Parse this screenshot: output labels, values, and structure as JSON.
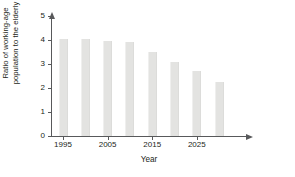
{
  "chart_data": {
    "type": "bar",
    "title": "",
    "xlabel": "Year",
    "ylabel_lines": [
      "Ratio of working-age",
      "population to the elderly"
    ],
    "ylabel": "Ratio of working-age population to the elderly",
    "categories": [
      "1995",
      "2000",
      "2005",
      "2010",
      "2015",
      "2020",
      "2025",
      "2030"
    ],
    "values": [
      4.05,
      4.05,
      3.95,
      3.92,
      3.5,
      3.1,
      2.7,
      2.25
    ],
    "x_tick_labels": [
      "1995",
      "2005",
      "2015",
      "2025"
    ],
    "x_tick_categories": [
      "1995",
      "2005",
      "2015",
      "2025"
    ],
    "y_tick_labels": [
      "0",
      "1",
      "2",
      "3",
      "4",
      "5"
    ],
    "ylim": [
      0,
      5
    ],
    "grid": false,
    "legend": "none",
    "bar_color": "#e3e3e1",
    "axis_color": "#58595b",
    "text_color": "#231f20"
  }
}
